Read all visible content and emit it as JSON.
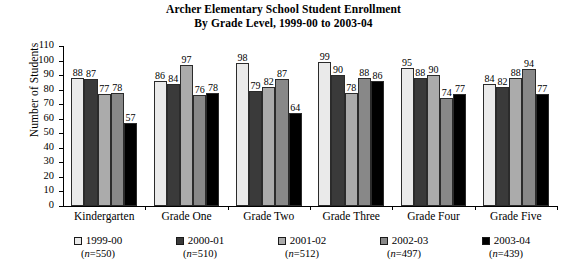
{
  "chart_data": {
    "type": "bar",
    "title": "Archer Elementary School Student Enrollment",
    "subtitle": "By Grade Level, 1999-00 to 2003-04",
    "xlabel": "",
    "ylabel": "Number of Students",
    "ylim": [
      0,
      110
    ],
    "ytick_step": 10,
    "grid": false,
    "legend_position": "bottom",
    "categories": [
      "Kindergarten",
      "Grade One",
      "Grade Two",
      "Grade Three",
      "Grade Four",
      "Grade Five"
    ],
    "yticks": [
      "0",
      "10",
      "20",
      "30",
      "40",
      "50",
      "60",
      "70",
      "80",
      "90",
      "100",
      "110"
    ],
    "series": [
      {
        "name": "1999-00",
        "n_label": "(n=550)",
        "n": 550,
        "color": "#eaeaea",
        "values": [
          88,
          86,
          98,
          99,
          95,
          84
        ]
      },
      {
        "name": "2000-01",
        "n_label": "(n=510)",
        "n": 510,
        "color": "#3a3a3a",
        "values": [
          87,
          84,
          79,
          90,
          88,
          82
        ]
      },
      {
        "name": "2001-02",
        "n_label": "(n=512)",
        "n": 512,
        "color": "#ababab",
        "values": [
          77,
          97,
          82,
          78,
          90,
          88
        ]
      },
      {
        "name": "2002-03",
        "n_label": "(n=497)",
        "n": 497,
        "color": "#888888",
        "values": [
          78,
          76,
          87,
          88,
          74,
          94
        ]
      },
      {
        "name": "2003-04",
        "n_label": "(n=439)",
        "n": 439,
        "color": "#000000",
        "values": [
          57,
          78,
          64,
          86,
          77,
          77
        ]
      }
    ]
  }
}
